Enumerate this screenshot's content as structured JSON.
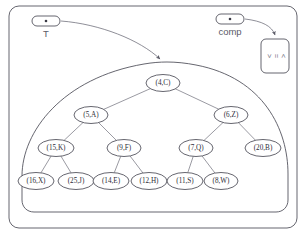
{
  "diagram": {
    "outer_frame": {
      "name": "outer-frame"
    },
    "variables": [
      {
        "id": "T",
        "label": "T",
        "box_x": 32,
        "box_y": 16,
        "box_w": 28,
        "box_h": 10,
        "label_x": 46,
        "label_y": 37,
        "points_to": "tree-region"
      },
      {
        "id": "comp",
        "label": "comp",
        "box_x": 216,
        "box_y": 14,
        "box_w": 28,
        "box_h": 10,
        "label_x": 230,
        "label_y": 35,
        "points_to": "comp-object"
      }
    ],
    "comp_object": {
      "name": "comp-object",
      "x": 261,
      "y": 39,
      "w": 28,
      "h": 34,
      "lines": [
        "<",
        "=",
        ">"
      ]
    },
    "tree": {
      "name": "binary-tree",
      "nodes": [
        {
          "id": "n4",
          "label": "(4,C)",
          "cx": 163,
          "cy": 83,
          "rx": 17,
          "ry": 8.5,
          "level": 0
        },
        {
          "id": "n5",
          "label": "(5,A)",
          "cx": 91,
          "cy": 115,
          "rx": 17,
          "ry": 8.5,
          "level": 1
        },
        {
          "id": "n6",
          "label": "(6,Z)",
          "cx": 231,
          "cy": 115,
          "rx": 17,
          "ry": 8.5,
          "level": 1
        },
        {
          "id": "n15",
          "label": "(15,K)",
          "cx": 56,
          "cy": 148,
          "rx": 18,
          "ry": 8.5,
          "level": 2
        },
        {
          "id": "n9",
          "label": "(9,F)",
          "cx": 124,
          "cy": 148,
          "rx": 17,
          "ry": 8.5,
          "level": 2
        },
        {
          "id": "n7",
          "label": "(7,Q)",
          "cx": 196,
          "cy": 148,
          "rx": 17,
          "ry": 8.5,
          "level": 2
        },
        {
          "id": "n20",
          "label": "(20,B)",
          "cx": 263,
          "cy": 148,
          "rx": 18,
          "ry": 8.5,
          "level": 2
        },
        {
          "id": "n16",
          "label": "(16,X)",
          "cx": 36,
          "cy": 181,
          "rx": 18,
          "ry": 8.5,
          "level": 3
        },
        {
          "id": "n25",
          "label": "(25,J)",
          "cx": 76,
          "cy": 181,
          "rx": 18,
          "ry": 8.5,
          "level": 3
        },
        {
          "id": "n14",
          "label": "(14,E)",
          "cx": 111,
          "cy": 181,
          "rx": 18,
          "ry": 8.5,
          "level": 3
        },
        {
          "id": "n12",
          "label": "(12,H)",
          "cx": 149,
          "cy": 181,
          "rx": 18,
          "ry": 8.5,
          "level": 3
        },
        {
          "id": "n11",
          "label": "(11,S)",
          "cx": 185,
          "cy": 181,
          "rx": 18,
          "ry": 8.5,
          "level": 3
        },
        {
          "id": "n8",
          "label": "(8,W)",
          "cx": 221,
          "cy": 181,
          "rx": 17,
          "ry": 8.5,
          "level": 3
        }
      ],
      "edges": [
        {
          "from": "n4",
          "to": "n5"
        },
        {
          "from": "n4",
          "to": "n6"
        },
        {
          "from": "n5",
          "to": "n15"
        },
        {
          "from": "n5",
          "to": "n9"
        },
        {
          "from": "n6",
          "to": "n7"
        },
        {
          "from": "n6",
          "to": "n20"
        },
        {
          "from": "n15",
          "to": "n16"
        },
        {
          "from": "n15",
          "to": "n25"
        },
        {
          "from": "n9",
          "to": "n14"
        },
        {
          "from": "n9",
          "to": "n12"
        },
        {
          "from": "n7",
          "to": "n11"
        },
        {
          "from": "n7",
          "to": "n8"
        }
      ]
    }
  }
}
